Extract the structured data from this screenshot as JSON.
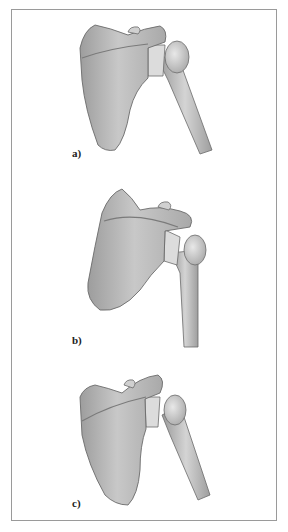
{
  "figure": {
    "panels": [
      {
        "label": "a)",
        "description": "scapula-humerus-view-a"
      },
      {
        "label": "b)",
        "description": "scapula-humerus-view-b"
      },
      {
        "label": "c)",
        "description": "scapula-humerus-view-c"
      }
    ],
    "colors": {
      "bone_fill": "#bdbdbd",
      "bone_light": "#d9d9d9",
      "bone_dark": "#8c8c8c",
      "outline": "#6b6b6b",
      "frame": "#9a9a9a"
    }
  }
}
